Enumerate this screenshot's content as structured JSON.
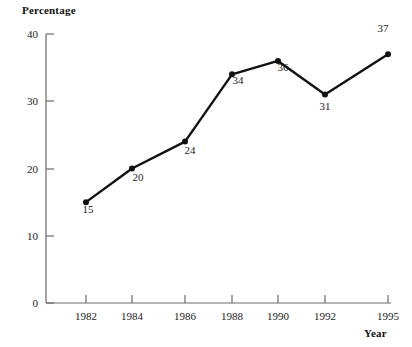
{
  "chart_data": {
    "type": "line",
    "title": "",
    "xlabel": "Year",
    "ylabel": "Percentage",
    "categories": [
      "1982",
      "1984",
      "1986",
      "1988",
      "1990",
      "1992",
      "1995"
    ],
    "x": [
      1982,
      1984,
      1986,
      1988,
      1990,
      1992,
      1995
    ],
    "values": [
      15,
      20,
      24,
      34,
      36,
      31,
      37
    ],
    "point_labels": [
      "15",
      "20",
      "24",
      "34",
      "36",
      "31",
      "37"
    ],
    "xlim": [
      1982,
      1995
    ],
    "ylim": [
      0,
      40
    ],
    "y_ticks": [
      "0",
      "10",
      "20",
      "30",
      "40"
    ],
    "x_ticks": [
      "1982",
      "1984",
      "1986",
      "1988",
      "1990",
      "1992",
      "1995"
    ],
    "grid": false,
    "legend": false,
    "series": [
      {
        "name": "Percentage",
        "values": [
          15,
          20,
          24,
          34,
          36,
          31,
          37
        ]
      }
    ],
    "colors": {
      "line": "#111111",
      "marker": "#111111",
      "axis": "#555555",
      "text": "#222222",
      "background": "#ffffff"
    }
  }
}
